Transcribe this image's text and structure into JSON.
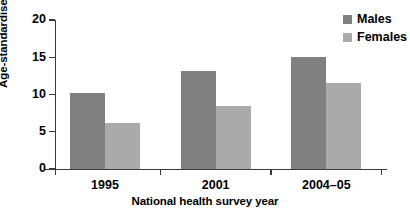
{
  "figure": {
    "clipped_header_text": "",
    "background": "#ffffff"
  },
  "chart_data": {
    "type": "bar",
    "title": "",
    "categories": [
      "1995",
      "2001",
      "2004–05"
    ],
    "series": [
      {
        "name": "Males",
        "values": [
          10.2,
          13.1,
          15.1
        ],
        "color": "#808080"
      },
      {
        "name": "Females",
        "values": [
          6.2,
          8.4,
          11.5
        ],
        "color": "#aaaaaa"
      }
    ],
    "xlabel": "National health survey year",
    "ylabel": "Age-standardised percentage",
    "ylim": [
      0,
      20
    ],
    "yticks": [
      0,
      5,
      10,
      15,
      20
    ],
    "ytick_labels": [
      "0",
      "5",
      "10",
      "15",
      "20"
    ],
    "grid": false,
    "legend_position": "top-right"
  },
  "legend": {
    "items": [
      {
        "label": "Males",
        "color": "#808080"
      },
      {
        "label": "Females",
        "color": "#aaaaaa"
      }
    ]
  },
  "colors": {
    "males": "#808080",
    "females": "#aaaaaa",
    "axis": "#3a3a3a",
    "text": "#000000"
  }
}
